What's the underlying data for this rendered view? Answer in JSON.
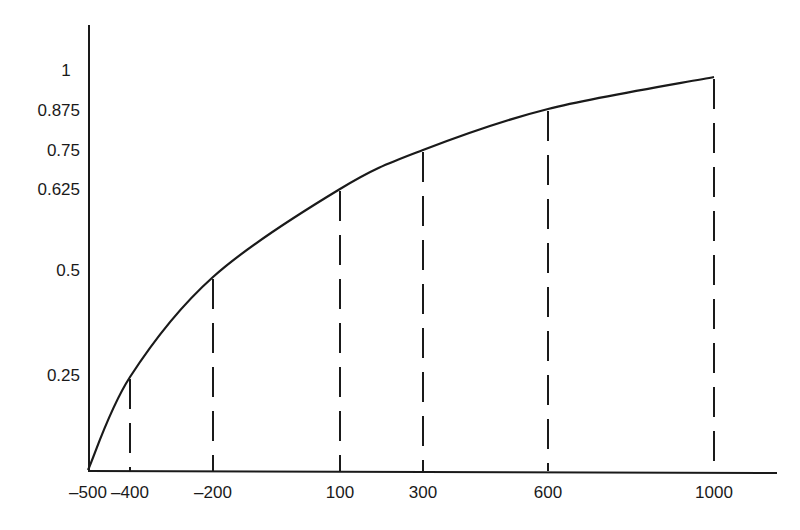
{
  "chart_data": {
    "type": "line",
    "title": "",
    "xlabel": "",
    "ylabel": "",
    "grid": false,
    "legend": null,
    "x_ticks": [
      "-500",
      "-400",
      "-200",
      "100",
      "300",
      "600",
      "1000"
    ],
    "y_ticks": [
      "1",
      "0.875",
      "0.75",
      "0.625",
      "0.5",
      "0.25"
    ],
    "series": [
      {
        "name": "curve",
        "x": [
          -500,
          -400,
          -200,
          100,
          300,
          600,
          1000
        ],
        "y": [
          0,
          0.25,
          0.5,
          0.625,
          0.75,
          0.875,
          1
        ]
      }
    ],
    "annotations": "Vertical dashed lines drop from the curve to the x-axis at x = -400, -200, 100, 300, 600, 1000"
  },
  "layout": {
    "origin": {
      "x": 88,
      "y": 470
    },
    "y_axis_top": 25,
    "x_axis_right": 777,
    "x_tick_px": [
      88,
      130,
      213,
      340,
      423,
      548,
      714
    ],
    "y_tick_px": [
      70,
      110,
      150,
      189,
      270,
      375
    ],
    "curve_points_px": [
      [
        88,
        470
      ],
      [
        130,
        377
      ],
      [
        213,
        277
      ],
      [
        340,
        189
      ],
      [
        423,
        150
      ],
      [
        548,
        109
      ],
      [
        714,
        77
      ]
    ]
  },
  "colors": {
    "ink": "#1a1a1a",
    "background": "#ffffff"
  }
}
